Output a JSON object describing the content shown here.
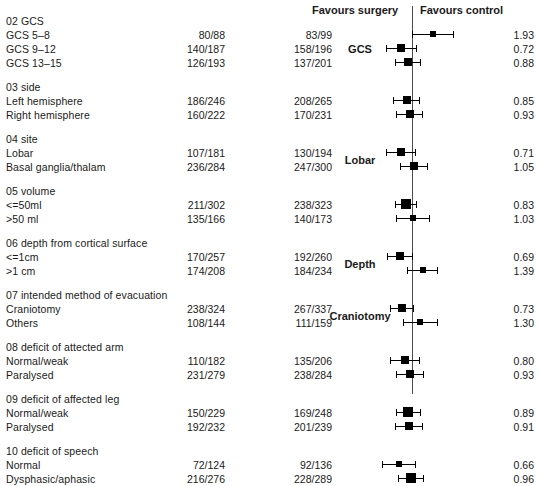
{
  "header": {
    "favours_left": "Favours surgery",
    "favours_right": "Favours control"
  },
  "columns": {
    "subgroup": "",
    "surgery_n": "",
    "control_n": "",
    "odds_ratio": ""
  },
  "chart_data": {
    "type": "forest",
    "title": "",
    "xlabel": "",
    "ylabel": "",
    "reference_line": 1.0,
    "effect_measure": "odds ratio",
    "axis_note_left": "Favours surgery",
    "axis_note_right": "Favours control",
    "groups": [
      {
        "id": "02",
        "heading": "02 GCS",
        "plot_label": "GCS",
        "rows": [
          {
            "label": "GCS 5–8",
            "surgery": "80/88",
            "control": "83/99",
            "or": 1.93,
            "ci_low": 1.0,
            "ci_high": 3.7,
            "marker": "small"
          },
          {
            "label": "GCS 9–12",
            "surgery": "140/187",
            "control": "158/196",
            "or": 0.72,
            "ci_low": 0.44,
            "ci_high": 1.16,
            "marker": "medium"
          },
          {
            "label": "GCS 13–15",
            "surgery": "126/193",
            "control": "137/201",
            "or": 0.88,
            "ci_low": 0.58,
            "ci_high": 1.33,
            "marker": "medium"
          }
        ]
      },
      {
        "id": "03",
        "heading": "03 side",
        "plot_label": "",
        "rows": [
          {
            "label": "Left hemisphere",
            "surgery": "186/246",
            "control": "208/265",
            "or": 0.85,
            "ci_low": 0.55,
            "ci_high": 1.3,
            "marker": "medium"
          },
          {
            "label": "Right hemisphere",
            "surgery": "160/222",
            "control": "170/231",
            "or": 0.93,
            "ci_low": 0.6,
            "ci_high": 1.42,
            "marker": "medium"
          }
        ]
      },
      {
        "id": "04",
        "heading": "04 site",
        "plot_label": "Lobar",
        "rows": [
          {
            "label": "Lobar",
            "surgery": "107/181",
            "control": "130/194",
            "or": 0.71,
            "ci_low": 0.45,
            "ci_high": 1.12,
            "marker": "medium"
          },
          {
            "label": "Basal ganglia/thalam",
            "surgery": "236/284",
            "control": "247/300",
            "or": 1.05,
            "ci_low": 0.68,
            "ci_high": 1.64,
            "marker": "medium"
          }
        ]
      },
      {
        "id": "05",
        "heading": "05 volume",
        "plot_label": "",
        "rows": [
          {
            "label": "<=50ml",
            "surgery": "211/302",
            "control": "238/323",
            "or": 0.83,
            "ci_low": 0.58,
            "ci_high": 1.18,
            "marker": "large"
          },
          {
            "label": ">50 ml",
            "surgery": "135/166",
            "control": "140/173",
            "or": 1.03,
            "ci_low": 0.6,
            "ci_high": 1.75,
            "marker": "small"
          }
        ]
      },
      {
        "id": "06",
        "heading": "06 depth from cortical surface",
        "plot_label": "Depth",
        "rows": [
          {
            "label": "<=1cm",
            "surgery": "170/257",
            "control": "192/260",
            "or": 0.69,
            "ci_low": 0.46,
            "ci_high": 1.03,
            "marker": "medium"
          },
          {
            "label": ">1 cm",
            "surgery": "174/208",
            "control": "184/234",
            "or": 1.39,
            "ci_low": 0.85,
            "ci_high": 2.28,
            "marker": "small"
          }
        ]
      },
      {
        "id": "07",
        "heading": "07 intended method of evacuation",
        "plot_label": "Craniotomy",
        "rows": [
          {
            "label": "Craniotomy",
            "surgery": "238/324",
            "control": "267/337",
            "or": 0.73,
            "ci_low": 0.51,
            "ci_high": 1.05,
            "marker": "medium"
          },
          {
            "label": "Others",
            "surgery": "108/144",
            "control": "111/159",
            "or": 1.3,
            "ci_low": 0.75,
            "ci_high": 2.25,
            "marker": "small"
          }
        ]
      },
      {
        "id": "08",
        "heading": "08 deficit of attected arm",
        "plot_label": "",
        "rows": [
          {
            "label": "Normal/weak",
            "surgery": "110/182",
            "control": "135/206",
            "or": 0.8,
            "ci_low": 0.5,
            "ci_high": 1.27,
            "marker": "medium"
          },
          {
            "label": "Paralysed",
            "surgery": "231/279",
            "control": "238/284",
            "or": 0.93,
            "ci_low": 0.6,
            "ci_high": 1.44,
            "marker": "medium"
          }
        ]
      },
      {
        "id": "09",
        "heading": "09 deficit of affected leg",
        "plot_label": "",
        "rows": [
          {
            "label": "Normal/weak",
            "surgery": "150/229",
            "control": "169/248",
            "or": 0.89,
            "ci_low": 0.6,
            "ci_high": 1.32,
            "marker": "large"
          },
          {
            "label": "Paralysed",
            "surgery": "192/232",
            "control": "201/239",
            "or": 0.91,
            "ci_low": 0.58,
            "ci_high": 1.43,
            "marker": "medium"
          }
        ]
      },
      {
        "id": "10",
        "heading": "10 deficit of speech",
        "plot_label": "",
        "rows": [
          {
            "label": "Normal",
            "surgery": "72/124",
            "control": "92/136",
            "or": 0.66,
            "ci_low": 0.39,
            "ci_high": 1.12,
            "marker": "small"
          },
          {
            "label": "Dysphasic/aphasic",
            "surgery": "216/276",
            "control": "228/289",
            "or": 0.96,
            "ci_low": 0.64,
            "ci_high": 1.44,
            "marker": "large"
          }
        ]
      }
    ]
  }
}
